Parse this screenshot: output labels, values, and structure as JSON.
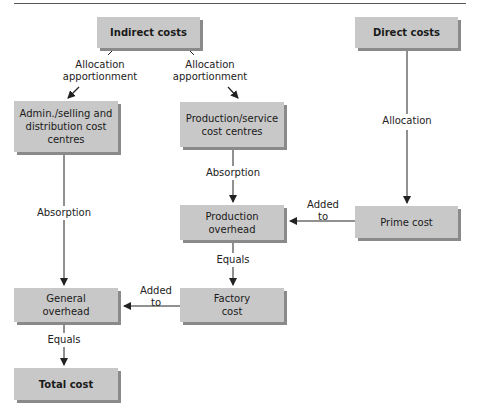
{
  "diagram": {
    "nodes": {
      "indirect_costs": "Indirect costs",
      "direct_costs": "Direct costs",
      "admin_centres_line1": "Admin./selling and",
      "admin_centres_line2": "distribution cost",
      "admin_centres_line3": "centres",
      "production_service_line1": "Production/service",
      "production_service_line2": "cost centres",
      "production_overhead_line1": "Production",
      "production_overhead_line2": "overhead",
      "prime_cost": "Prime cost",
      "factory_cost_line1": "Factory",
      "factory_cost_line2": "cost",
      "general_overhead_line1": "General",
      "general_overhead_line2": "overhead",
      "total_cost": "Total cost"
    },
    "edge_labels": {
      "alloc_left_line1": "Allocation",
      "alloc_left_line2": "apportionment",
      "alloc_right_line1": "Allocation",
      "alloc_right_line2": "apportionment",
      "direct_allocation": "Allocation",
      "absorption_left": "Absorption",
      "absorption_center": "Absorption",
      "added_to_prime_line1": "Added",
      "added_to_prime_line2": "to",
      "equals_center": "Equals",
      "added_to_factory_line1": "Added",
      "added_to_factory_line2": "to",
      "equals_left": "Equals"
    },
    "colors": {
      "box_fill": "#c8c8c8",
      "box_shadow": "#8a8a8a",
      "line": "#222222"
    }
  }
}
